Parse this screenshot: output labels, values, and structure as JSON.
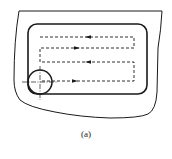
{
  "figure": {
    "caption": "(a)",
    "colors": {
      "stroke": "#1a1a1a",
      "background": "#ffffff"
    },
    "elements": {
      "workpiece_outline": "irregular outer boundary",
      "pocket_outline": "rounded rectangle",
      "tool_path": {
        "style": "dashed",
        "passes": [
          {
            "direction": "left",
            "y": 37
          },
          {
            "direction": "right",
            "y": 48
          },
          {
            "direction": "left",
            "y": 62
          },
          {
            "direction": "right",
            "y": 81
          }
        ]
      },
      "cutter": {
        "shape": "circle",
        "center": [
          40,
          82
        ],
        "radius": 12,
        "centerlines": "dash-dot crosshair"
      }
    }
  }
}
